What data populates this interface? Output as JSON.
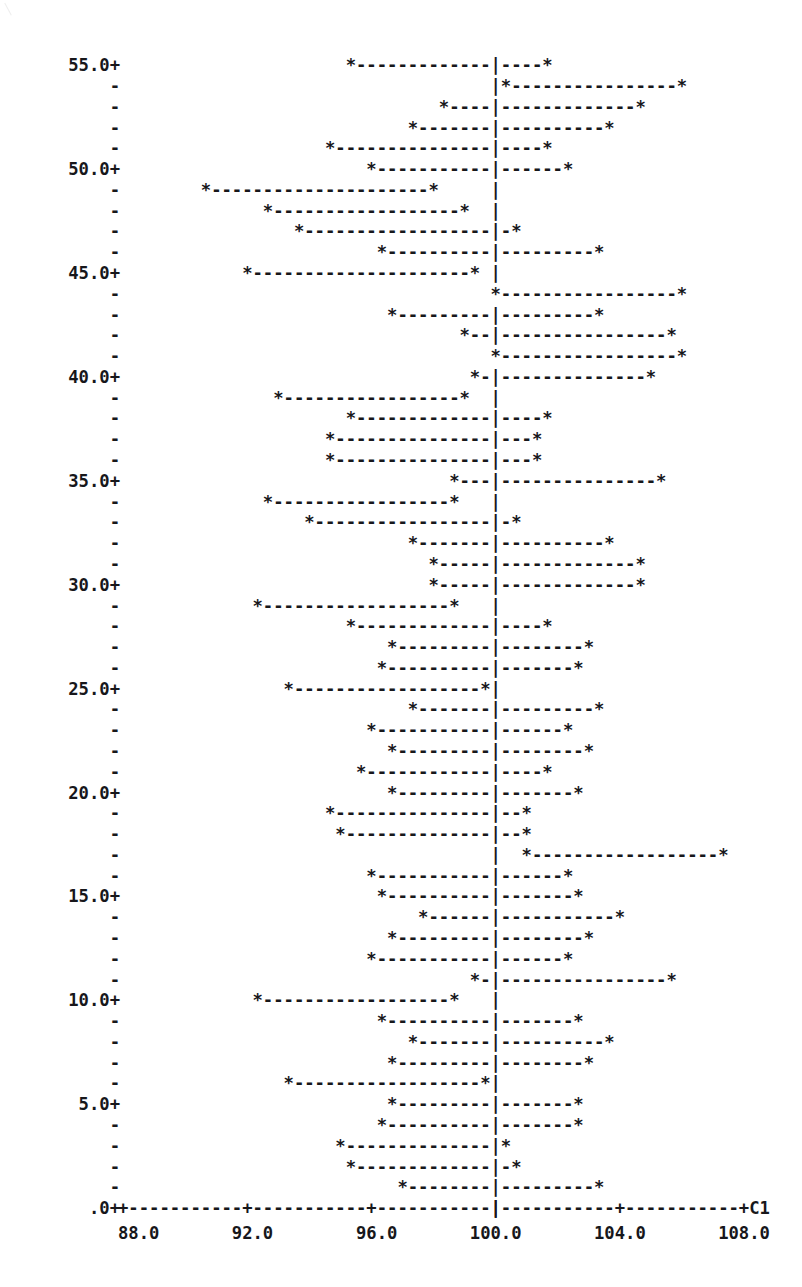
{
  "figure": {
    "type": "character-plot",
    "axis_label_right": "C1",
    "y_axis": {
      "tick_labels": [
        "55.0+",
        "50.0+",
        "45.0+",
        "40.0+",
        "35.0+",
        "30.0+",
        "25.0+",
        "20.0+",
        "15.0+",
        "10.0+",
        "5.0+",
        ".0+"
      ],
      "minor_tick_glyph": "-",
      "major_tick_glyph": "+",
      "label_every": 5,
      "min": 0,
      "max": 55
    },
    "x_axis": {
      "tick_labels": [
        "88.0",
        "92.0",
        "96.0",
        "100.0",
        "104.0",
        "108.0"
      ],
      "tick_values": [
        88,
        92,
        96,
        100,
        104,
        108
      ],
      "min": 88,
      "max": 108,
      "tick_glyph": "+",
      "line_glyph": "-",
      "reference_line_value": 100,
      "reference_line_glyph": ":"
    },
    "glyphs": {
      "point_marker": "*",
      "interval_line": "-",
      "reference_dash": "|"
    }
  },
  "chart_data": {
    "type": "line",
    "title": "",
    "subtitle": "",
    "xlabel": "C1",
    "ylabel": "",
    "xlim": [
      88,
      108
    ],
    "ylim": [
      0,
      55
    ],
    "grid": false,
    "legend": "none",
    "annotations": [
      "C1"
    ],
    "reference_line": 100,
    "x": [
      88.0,
      92.0,
      96.0,
      100.0,
      104.0,
      108.0
    ],
    "categories": [
      "55",
      "54",
      "53",
      "52",
      "51",
      "50",
      "49",
      "48",
      "47",
      "46",
      "45",
      "44",
      "43",
      "42",
      "41",
      "40",
      "39",
      "38",
      "37",
      "36",
      "35",
      "34",
      "33",
      "32",
      "31",
      "30",
      "29",
      "28",
      "27",
      "26",
      "25",
      "24",
      "23",
      "22",
      "21",
      "20",
      "19",
      "18",
      "17",
      "16",
      "15",
      "14",
      "13",
      "12",
      "11",
      "10",
      "9",
      "8",
      "7",
      "6",
      "5",
      "4",
      "3",
      "2",
      "1"
    ],
    "series": [
      {
        "name": "confidence interval lower limit",
        "values": [
          95.2,
          100.2,
          98.2,
          97.3,
          94.8,
          95.9,
          90.7,
          92.6,
          93.5,
          96.3,
          92.1,
          100.1,
          96.5,
          98.9,
          100.1,
          99.2,
          93.0,
          95.4,
          94.7,
          94.5,
          98.8,
          92.5,
          94.1,
          97.2,
          98.0,
          98.0,
          92.3,
          95.3,
          96.5,
          96.3,
          93.4,
          97.3,
          96.0,
          96.6,
          95.6,
          96.6,
          94.7,
          94.9,
          101.0,
          96.0,
          96.4,
          97.7,
          96.7,
          96.1,
          99.4,
          92.2,
          96.4,
          97.3,
          96.6,
          93.4,
          96.5,
          96.4,
          95.1,
          95.3,
          97.0
        ],
        "values_label": "lower"
      },
      {
        "name": "confidence interval upper limit",
        "values": [
          101.6,
          106.0,
          104.8,
          103.7,
          101.5,
          102.4,
          98.1,
          99.0,
          100.6,
          103.2,
          99.3,
          105.9,
          103.2,
          105.5,
          106.1,
          104.9,
          99.1,
          101.8,
          101.4,
          101.2,
          105.3,
          98.8,
          100.5,
          103.5,
          104.5,
          104.5,
          98.6,
          101.6,
          103.0,
          102.8,
          99.7,
          103.4,
          102.3,
          102.9,
          101.8,
          102.8,
          100.9,
          101.1,
          107.4,
          102.3,
          102.7,
          104.0,
          103.0,
          102.4,
          105.7,
          98.5,
          102.7,
          103.6,
          102.9,
          99.6,
          102.8,
          102.7,
          100.2,
          100.5,
          103.3
        ],
        "values_label": "upper"
      }
    ]
  }
}
